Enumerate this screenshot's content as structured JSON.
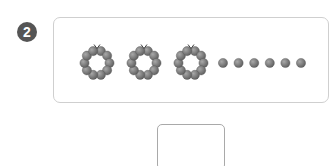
{
  "problem": {
    "number": "2",
    "rings": {
      "count": 3,
      "beads_per_ring": 10
    },
    "loose_beads": 6,
    "bead_color": "#7a7a7a",
    "answer_value": ""
  }
}
